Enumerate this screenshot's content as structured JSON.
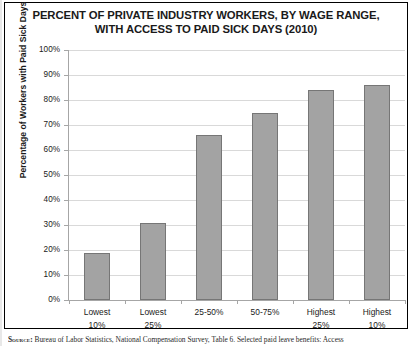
{
  "chart_data": {
    "type": "bar",
    "title": "PERCENT OF PRIVATE INDUSTRY WORKERS, BY WAGE RANGE, WITH ACCESS TO PAID SICK DAYS (2010)",
    "title_lines": [
      "PERCENT OF PRIVATE INDUSTRY WORKERS, BY WAGE RANGE,",
      "WITH ACCESS TO PAID SICK DAYS (2010)"
    ],
    "xlabel": "",
    "ylabel": "Percentage of Workers with Paid Sick Days",
    "ylim": [
      0,
      100
    ],
    "grid": true,
    "legend": "none",
    "categories": [
      "Lowest 10%",
      "Lowest 25%",
      "25-50%",
      "50-75%",
      "Highest 25%",
      "Highest 10%"
    ],
    "category_lines": [
      [
        "Lowest",
        "10%"
      ],
      [
        "Lowest",
        "25%"
      ],
      [
        "25-50%",
        ""
      ],
      [
        "50-75%",
        ""
      ],
      [
        "Highest",
        "25%"
      ],
      [
        "Highest",
        "10%"
      ]
    ],
    "values": [
      19,
      31,
      66,
      75,
      84,
      86
    ],
    "ytick_labels": [
      "100%",
      "90%",
      "80%",
      "70%",
      "60%",
      "50%",
      "40%",
      "30%",
      "20%",
      "10%",
      "0%"
    ],
    "ytick_values": [
      100,
      90,
      80,
      70,
      60,
      50,
      40,
      30,
      20,
      10,
      0
    ],
    "bar_color": "#a3a3a3",
    "bar_border_color": "#767676",
    "gridline_color": "#d9d9d9",
    "axis_color": "#a6a6a6"
  },
  "source": {
    "lead": "Source:",
    "text": " Bureau of Labor Statistics, National Compensation Survey, Table 6. Selected paid leave benefits: Access"
  }
}
